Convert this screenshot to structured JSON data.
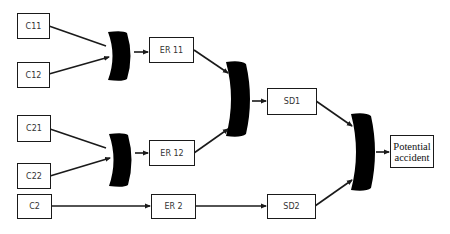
{
  "diagram": {
    "type": "fault-tree",
    "nodes": {
      "c11": {
        "label": "C11"
      },
      "c12": {
        "label": "C12"
      },
      "c21": {
        "label": "C21"
      },
      "c22": {
        "label": "C22"
      },
      "c2": {
        "label": "C2"
      },
      "er11": {
        "label": "ER 11"
      },
      "er12": {
        "label": "ER 12"
      },
      "er2": {
        "label": "ER 2"
      },
      "sd1": {
        "label": "SD1"
      },
      "sd2": {
        "label": "SD2"
      },
      "top": {
        "line1": "Potential",
        "line2": "accident"
      }
    },
    "gates": [
      {
        "id": "gate-1",
        "type": "and",
        "inputs": [
          "C11",
          "C12"
        ],
        "output": "ER 11"
      },
      {
        "id": "gate-2",
        "type": "and",
        "inputs": [
          "C21",
          "C22"
        ],
        "output": "ER 12"
      },
      {
        "id": "gate-3",
        "type": "and",
        "inputs": [
          "ER 11",
          "ER 12"
        ],
        "output": "SD1"
      },
      {
        "id": "gate-4",
        "type": "and",
        "inputs": [
          "SD1",
          "SD2"
        ],
        "output": "Potential accident"
      }
    ],
    "edges": [
      [
        "C11",
        "gate-1"
      ],
      [
        "C12",
        "gate-1"
      ],
      [
        "gate-1",
        "ER 11"
      ],
      [
        "C21",
        "gate-2"
      ],
      [
        "C22",
        "gate-2"
      ],
      [
        "gate-2",
        "ER 12"
      ],
      [
        "ER 11",
        "gate-3"
      ],
      [
        "ER 12",
        "gate-3"
      ],
      [
        "gate-3",
        "SD1"
      ],
      [
        "C2",
        "ER 2"
      ],
      [
        "ER 2",
        "SD2"
      ],
      [
        "SD1",
        "gate-4"
      ],
      [
        "SD2",
        "gate-4"
      ],
      [
        "gate-4",
        "Potential accident"
      ]
    ],
    "colors": {
      "line": "#1a1a1a",
      "gate": "#000000",
      "box_border": "#1a1a1a",
      "text": "#333333"
    }
  }
}
